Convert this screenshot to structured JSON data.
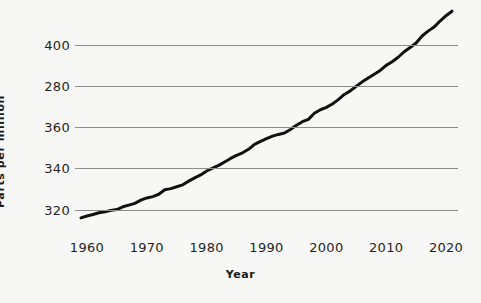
{
  "chart_data": {
    "type": "line",
    "title": "",
    "xlabel": "Year",
    "ylabel": "Parts per million",
    "xlim": [
      1958,
      2022
    ],
    "ylim": [
      313,
      418
    ],
    "grid": true,
    "legend": null,
    "x_ticks": [
      1960,
      1970,
      1980,
      1990,
      2000,
      2010,
      2020
    ],
    "x_tick_labels": [
      "1960",
      "1970",
      "1980",
      "1990",
      "2000",
      "2010",
      "2020"
    ],
    "y_ticks": [
      320,
      340,
      360,
      380,
      400
    ],
    "y_tick_labels": [
      "320",
      "340",
      "360",
      "280",
      "400"
    ],
    "series": [
      {
        "name": "Atmospheric CO2 concentration",
        "color": "#111111",
        "line_width": 3,
        "x": [
          1959,
          1960,
          1961,
          1962,
          1963,
          1964,
          1965,
          1966,
          1967,
          1968,
          1969,
          1970,
          1971,
          1972,
          1973,
          1974,
          1975,
          1976,
          1977,
          1978,
          1979,
          1980,
          1981,
          1982,
          1983,
          1984,
          1985,
          1986,
          1987,
          1988,
          1989,
          1990,
          1991,
          1992,
          1993,
          1994,
          1995,
          1996,
          1997,
          1998,
          1999,
          2000,
          2001,
          2002,
          2003,
          2004,
          2005,
          2006,
          2007,
          2008,
          2009,
          2010,
          2011,
          2012,
          2013,
          2014,
          2015,
          2016,
          2017,
          2018,
          2019,
          2020,
          2021
        ],
        "values": [
          315.98,
          316.91,
          317.64,
          318.45,
          318.99,
          319.62,
          320.04,
          321.37,
          322.18,
          323.05,
          324.62,
          325.68,
          326.32,
          327.46,
          329.68,
          330.19,
          331.12,
          332.03,
          333.84,
          335.41,
          336.84,
          338.76,
          340.12,
          341.48,
          343.15,
          344.87,
          346.35,
          347.61,
          349.31,
          351.69,
          353.2,
          354.45,
          355.7,
          356.54,
          357.21,
          358.96,
          360.97,
          362.74,
          363.88,
          366.84,
          368.54,
          369.71,
          371.32,
          373.45,
          375.98,
          377.7,
          379.98,
          382.09,
          384.02,
          385.83,
          387.64,
          390.1,
          391.85,
          394.06,
          396.74,
          398.81,
          401.01,
          404.41,
          406.76,
          408.72,
          411.65,
          414.24,
          416.45
        ],
        "units": "ppm"
      }
    ]
  },
  "axes": {
    "y_title": "Parts per million",
    "x_title": "Year"
  }
}
